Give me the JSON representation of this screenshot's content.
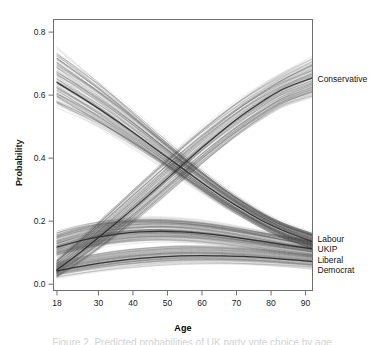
{
  "figure": {
    "caption": "Figure 2. Predicted probabilities of UK party vote choice by age",
    "background": "#ffffff",
    "frame_color": "#6e6e6e"
  },
  "chart_data": {
    "type": "line",
    "title": "",
    "subtitle": "",
    "xlabel": "Age",
    "ylabel": "Probability",
    "xlim": [
      17,
      92
    ],
    "ylim": [
      -0.02,
      0.84
    ],
    "xticks": [
      18,
      30,
      40,
      50,
      60,
      70,
      80,
      90
    ],
    "xtick_labels": [
      "18",
      "30",
      "40",
      "50",
      "60",
      "70",
      "80",
      "90"
    ],
    "yticks": [
      0.0,
      0.2,
      0.4,
      0.6,
      0.8
    ],
    "ytick_labels": [
      "0.0",
      "0.2",
      "0.4",
      "0.6",
      "0.8"
    ],
    "grid": false,
    "legend_position": "right-inline-labels",
    "style": "spaghetti plot of simulated draws with bold mean curve per party",
    "x": [
      18,
      24,
      30,
      36,
      42,
      48,
      54,
      60,
      66,
      72,
      78,
      84,
      92
    ],
    "series": [
      {
        "name": "Labour",
        "label": "Labour",
        "label_y": 0.145,
        "color": "#3a3a3a",
        "draws": 150,
        "values": [
          0.64,
          0.6,
          0.558,
          0.513,
          0.466,
          0.418,
          0.37,
          0.322,
          0.277,
          0.236,
          0.198,
          0.168,
          0.135
        ],
        "band_low": [
          0.56,
          0.528,
          0.494,
          0.456,
          0.416,
          0.374,
          0.33,
          0.287,
          0.244,
          0.206,
          0.17,
          0.14,
          0.108
        ],
        "band_high": [
          0.762,
          0.712,
          0.66,
          0.604,
          0.546,
          0.486,
          0.428,
          0.372,
          0.32,
          0.274,
          0.234,
          0.202,
          0.172
        ]
      },
      {
        "name": "Conservative",
        "label": "Conservative",
        "label_y": 0.652,
        "color": "#4a4a4a",
        "draws": 150,
        "values": [
          0.045,
          0.095,
          0.148,
          0.202,
          0.258,
          0.316,
          0.375,
          0.433,
          0.488,
          0.539,
          0.584,
          0.622,
          0.655
        ],
        "band_low": [
          0.02,
          0.058,
          0.103,
          0.152,
          0.204,
          0.258,
          0.314,
          0.37,
          0.424,
          0.474,
          0.518,
          0.556,
          0.586
        ],
        "band_high": [
          0.088,
          0.148,
          0.21,
          0.272,
          0.334,
          0.394,
          0.452,
          0.506,
          0.556,
          0.602,
          0.642,
          0.678,
          0.722
        ]
      },
      {
        "name": "UKIP",
        "label": "UKIP",
        "label_y": 0.112,
        "color": "#555555",
        "draws": 150,
        "values": [
          0.118,
          0.136,
          0.15,
          0.16,
          0.166,
          0.168,
          0.166,
          0.161,
          0.154,
          0.145,
          0.135,
          0.125,
          0.112
        ],
        "band_low": [
          0.078,
          0.096,
          0.11,
          0.12,
          0.127,
          0.13,
          0.129,
          0.125,
          0.119,
          0.111,
          0.102,
          0.093,
          0.082
        ],
        "band_high": [
          0.172,
          0.192,
          0.206,
          0.214,
          0.218,
          0.218,
          0.214,
          0.207,
          0.197,
          0.185,
          0.172,
          0.159,
          0.144
        ]
      },
      {
        "name": "Liberal Democrat",
        "label_line1": "Liberal",
        "label_line2": "Democrat",
        "label_y": 0.078,
        "color": "#7d7d7d",
        "draws": 150,
        "values": [
          0.042,
          0.055,
          0.066,
          0.075,
          0.082,
          0.087,
          0.09,
          0.091,
          0.09,
          0.088,
          0.084,
          0.079,
          0.072
        ],
        "band_low": [
          0.018,
          0.028,
          0.037,
          0.045,
          0.051,
          0.056,
          0.059,
          0.06,
          0.06,
          0.058,
          0.055,
          0.051,
          0.045
        ],
        "band_high": [
          0.074,
          0.09,
          0.103,
          0.113,
          0.12,
          0.125,
          0.128,
          0.128,
          0.126,
          0.122,
          0.117,
          0.11,
          0.101
        ]
      }
    ],
    "annotations": [
      {
        "text": "Labour and Conservative curves cross near age 52 at probability 0.40"
      }
    ]
  }
}
